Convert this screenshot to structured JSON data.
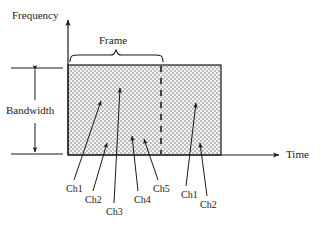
{
  "figure": {
    "title_axes": {
      "y_axis_label": "Frequency",
      "x_axis_label": "Time"
    },
    "annotations": {
      "bandwidth_label": "Bandwidth",
      "frame_label": "Frame"
    },
    "channel_labels": [
      {
        "id": "ch1-left",
        "text": "Ch1",
        "x": 66,
        "y": 184,
        "tip_x": 101,
        "tip_y": 100
      },
      {
        "id": "ch2-left",
        "text": "Ch2",
        "x": 85,
        "y": 195,
        "tip_x": 107,
        "tip_y": 142
      },
      {
        "id": "ch3-left",
        "text": "Ch3",
        "x": 106,
        "y": 207,
        "tip_x": 120,
        "tip_y": 87
      },
      {
        "id": "ch4-left",
        "text": "Ch4",
        "x": 134,
        "y": 195,
        "tip_x": 132,
        "tip_y": 135
      },
      {
        "id": "ch5-left",
        "text": "Ch5",
        "x": 153,
        "y": 184,
        "tip_x": 144,
        "tip_y": 138
      },
      {
        "id": "ch1-right",
        "text": "Ch1",
        "x": 181,
        "y": 190,
        "tip_x": 196,
        "tip_y": 102
      },
      {
        "id": "ch2-right",
        "text": "Ch2",
        "x": 200,
        "y": 200,
        "tip_x": 200,
        "tip_y": 142
      }
    ],
    "geometry": {
      "y_axis_x": 68,
      "y_axis_top": 18,
      "x_axis_y": 155,
      "x_axis_end": 280,
      "rect_left": 68,
      "rect_right": 221,
      "rect_top": 65,
      "rect_bottom": 155,
      "frame_divider_x": 161,
      "brace_left": 70,
      "brace_right": 163,
      "brace_y": 62,
      "bandwidth_tick_left": 11,
      "bandwidth_tick_right": 63,
      "bandwidth_arrow_x": 35
    },
    "colors": {
      "stroke": "#1a1a1a",
      "fill_pattern_light": "#f2f2f2",
      "fill_pattern_dark": "#bdbdbd",
      "background": "#ffffff"
    }
  }
}
